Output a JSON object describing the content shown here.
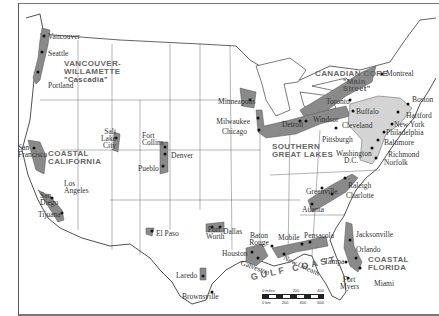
{
  "map": {
    "regions": [
      {
        "id": "vancouver-willamette",
        "label": "VANCOUVER-WILLAMETTE",
        "alt": "\"Cascadia\""
      },
      {
        "id": "coastal-california",
        "label": "COASTAL CALIFORNIA"
      },
      {
        "id": "canadian-core",
        "label": "CANADIAN CORE",
        "alt": "\"Main Street\""
      },
      {
        "id": "southern-great-lakes",
        "label": "SOUTHERN GREAT LAKES"
      },
      {
        "id": "gulf-coast",
        "label": "GULF COAST"
      },
      {
        "id": "coastal-florida",
        "label": "COASTAL FLORIDA"
      },
      {
        "id": "bos-wash",
        "label": "BOS-WASH"
      }
    ],
    "cities": {
      "vancouver": "Vancouver",
      "seattle": "Seattle",
      "portland": "Portland",
      "san_francisco": "San Francisco",
      "los_angeles": "Los Angeles",
      "san_diego": "San Diego",
      "tijuana": "Tijuana",
      "salt_lake_city": "Salt Lake City",
      "fort_collins": "Fort Collins",
      "denver": "Denver",
      "pueblo": "Pueblo",
      "minneapolis": "Minneapolis",
      "milwaukee": "Milwaukee",
      "chicago": "Chicago",
      "detroit": "Detroit",
      "windsor": "Windsor",
      "cleveland": "Cleveland",
      "pittsburgh": "Pittsburgh",
      "toronto": "Toronto",
      "buffalo": "Buffalo",
      "montreal": "Montreal",
      "boston": "Boston",
      "hartford": "Hartford",
      "new_york": "New York",
      "philadelphia": "Philadelphia",
      "baltimore": "Baltimore",
      "washington": "Washington D.C.",
      "richmond": "Richmond",
      "norfolk": "Norfolk",
      "raleigh": "Raleigh",
      "charlotte": "Charlotte",
      "greenville": "Greenville",
      "atlanta": "Atlanta",
      "el_paso": "El Paso",
      "fort_worth": "Fort Worth",
      "dallas": "Dallas",
      "houston": "Houston",
      "galveston": "Galveston",
      "baton_rouge": "Baton Rouge",
      "new_orleans": "New Orleans",
      "mobile": "Mobile",
      "pensacola": "Pensacola",
      "laredo": "Laredo",
      "brownsville": "Brownsville",
      "jacksonville": "Jacksonville",
      "orlando": "Orlando",
      "tampa": "Tampa",
      "fort_myers": "Fort Myers",
      "miami": "Miami"
    },
    "scale": {
      "miles_label": "0 miles",
      "miles_ticks": [
        "200",
        "400"
      ],
      "km_label": "0 km",
      "km_ticks": [
        "200",
        "400",
        "600"
      ]
    },
    "colors": {
      "dark_region": "#8a8a8a",
      "light_region": "#d4d4d4",
      "border": "#222222",
      "water": "#ffffff"
    }
  }
}
